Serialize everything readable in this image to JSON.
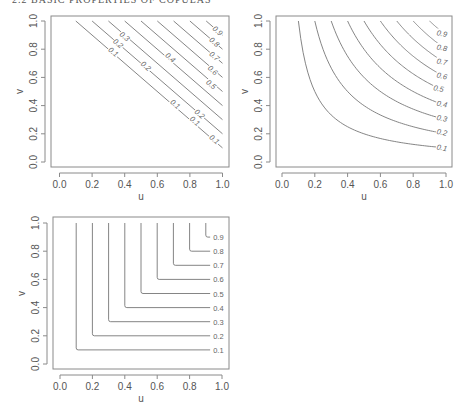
{
  "page": {
    "header_text": "2.2 BASIC PROPERTIES OF COPULAS",
    "page_number": "11"
  },
  "chart_data": [
    {
      "id": "lower-frechet-bound",
      "type": "contour",
      "function": "W(u,v) = max(u+v-1, 0)",
      "xlabel": "u",
      "ylabel": "v",
      "xlim": [
        0,
        1
      ],
      "ylim": [
        0,
        1
      ],
      "xticks": [
        "0.0",
        "0.2",
        "0.4",
        "0.6",
        "0.8",
        "1.0"
      ],
      "yticks": [
        "0.0",
        "0.2",
        "0.4",
        "0.6",
        "0.8",
        "1.0"
      ],
      "levels": [
        0.1,
        0.2,
        0.3,
        0.4,
        0.5,
        0.6,
        0.7,
        0.8,
        0.9
      ],
      "grid": false,
      "frame": {
        "x0": 51,
        "x1": 229,
        "y0": 16,
        "y1": 167
      },
      "map": {
        "px0": 59.5,
        "px1": 222.5,
        "py0": 162,
        "py1": 21
      },
      "lines_start_u": [
        0.1,
        0.2,
        0.3,
        0.4,
        0.5,
        0.6,
        0.7,
        0.8,
        0.9
      ],
      "labels": [
        {
          "text": "0.1",
          "u": 0.33,
          "v": 0.78
        },
        {
          "text": "0.2",
          "u": 0.36,
          "v": 0.84
        },
        {
          "text": "0.3",
          "u": 0.4,
          "v": 0.89
        },
        {
          "text": "0.2",
          "u": 0.53,
          "v": 0.68
        },
        {
          "text": "0.4",
          "u": 0.68,
          "v": 0.74
        },
        {
          "text": "0.1",
          "u": 0.71,
          "v": 0.41
        },
        {
          "text": "0.2",
          "u": 0.86,
          "v": 0.34
        },
        {
          "text": "0.1",
          "u": 0.83,
          "v": 0.29
        },
        {
          "text": "0.1",
          "u": 0.95,
          "v": 0.16
        },
        {
          "text": "0.5",
          "u": 0.93,
          "v": 0.55
        },
        {
          "text": "0.6",
          "u": 0.94,
          "v": 0.65
        },
        {
          "text": "0.7",
          "u": 0.95,
          "v": 0.75
        },
        {
          "text": "0.8",
          "u": 0.95,
          "v": 0.85
        },
        {
          "text": "0.9",
          "u": 0.97,
          "v": 0.93
        }
      ]
    },
    {
      "id": "product-copula",
      "type": "contour",
      "function": "Pi(u,v) = u*v",
      "xlabel": "u",
      "ylabel": "v",
      "xlim": [
        0,
        1
      ],
      "ylim": [
        0,
        1
      ],
      "xticks": [
        "0.0",
        "0.2",
        "0.4",
        "0.6",
        "0.8",
        "1.0"
      ],
      "yticks": [
        "0.0",
        "0.2",
        "0.4",
        "0.6",
        "0.8",
        "1.0"
      ],
      "levels": [
        0.1,
        0.2,
        0.3,
        0.4,
        0.5,
        0.6,
        0.7,
        0.8,
        0.9
      ],
      "grid": false,
      "frame": {
        "x0": 276,
        "x1": 452,
        "y0": 16,
        "y1": 167
      },
      "map": {
        "px0": 282,
        "px1": 446,
        "py0": 162,
        "py1": 21
      },
      "labels": [
        {
          "text": "0.1",
          "u": 0.975,
          "v": 0.1
        },
        {
          "text": "0.2",
          "u": 0.975,
          "v": 0.21
        },
        {
          "text": "0.3",
          "u": 0.975,
          "v": 0.31
        },
        {
          "text": "0.4",
          "u": 0.975,
          "v": 0.41
        },
        {
          "text": "0.5",
          "u": 0.955,
          "v": 0.52
        },
        {
          "text": "0.6",
          "u": 0.975,
          "v": 0.61
        },
        {
          "text": "0.7",
          "u": 0.975,
          "v": 0.71
        },
        {
          "text": "0.8",
          "u": 0.975,
          "v": 0.81
        },
        {
          "text": "0.9",
          "u": 0.975,
          "v": 0.91
        }
      ]
    },
    {
      "id": "upper-frechet-bound",
      "type": "contour",
      "function": "M(u,v) = min(u,v)",
      "xlabel": "u",
      "ylabel": "v",
      "xlim": [
        0,
        1
      ],
      "ylim": [
        0,
        1
      ],
      "xticks": [
        "0.0",
        "0.2",
        "0.4",
        "0.6",
        "0.8",
        "1.0"
      ],
      "yticks": [
        "0.0",
        "0.2",
        "0.4",
        "0.6",
        "0.8",
        "1.0"
      ],
      "levels": [
        0.1,
        0.2,
        0.3,
        0.4,
        0.5,
        0.6,
        0.7,
        0.8,
        0.9
      ],
      "grid": false,
      "frame": {
        "x0": 53,
        "x1": 229,
        "y0": 217,
        "y1": 369
      },
      "map": {
        "px0": 60,
        "px1": 222,
        "py0": 364,
        "py1": 223
      },
      "labels": [
        {
          "text": "0.1",
          "u": 0.97,
          "v": 0.1
        },
        {
          "text": "0.2",
          "u": 0.97,
          "v": 0.2
        },
        {
          "text": "0.3",
          "u": 0.97,
          "v": 0.3
        },
        {
          "text": "0.4",
          "u": 0.97,
          "v": 0.4
        },
        {
          "text": "0.5",
          "u": 0.97,
          "v": 0.5
        },
        {
          "text": "0.6",
          "u": 0.97,
          "v": 0.6
        },
        {
          "text": "0.7",
          "u": 0.97,
          "v": 0.7
        },
        {
          "text": "0.8",
          "u": 0.97,
          "v": 0.8
        },
        {
          "text": "0.9",
          "u": 0.97,
          "v": 0.9
        }
      ]
    }
  ]
}
